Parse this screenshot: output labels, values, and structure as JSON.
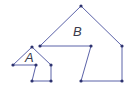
{
  "diagram": {
    "type": "similar-polygons",
    "line_color": "#5b62a8",
    "point_color": "#2e3370",
    "label_color": "#3a3a4a",
    "shapes": [
      {
        "name": "A",
        "label": "A",
        "label_pos": [
          25,
          62
        ],
        "vertices": [
          [
            32,
            47
          ],
          [
            51,
            65
          ],
          [
            51,
            81
          ],
          [
            32,
            81
          ],
          [
            36,
            65
          ],
          [
            13,
            65
          ]
        ]
      },
      {
        "name": "B",
        "label": "B",
        "label_pos": [
          73,
          36
        ],
        "vertices": [
          [
            81,
            6
          ],
          [
            122,
            46
          ],
          [
            122,
            81
          ],
          [
            81,
            81
          ],
          [
            91,
            46
          ],
          [
            40,
            46
          ]
        ]
      }
    ]
  }
}
